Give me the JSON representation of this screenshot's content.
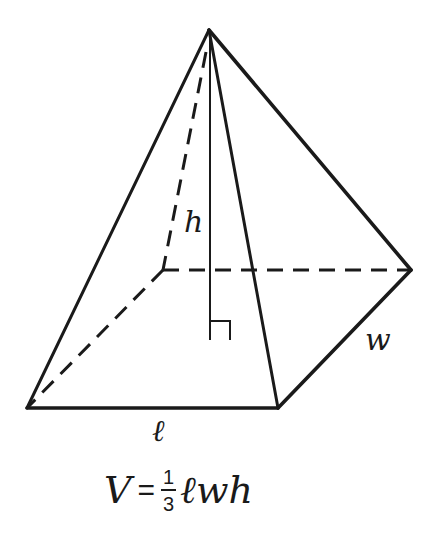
{
  "figure": {
    "type": "rectangular-pyramid",
    "vertices": {
      "apex": [
        209,
        30
      ],
      "front_left": [
        27,
        408
      ],
      "front_right": [
        278,
        408
      ],
      "back_right": [
        411,
        270
      ],
      "back_left": [
        163,
        270
      ],
      "height_foot": [
        210,
        340
      ]
    },
    "colors": {
      "stroke": "#1a1a1a",
      "background": "#ffffff"
    }
  },
  "labels": {
    "height": "h",
    "width": "w",
    "length": "ℓ"
  },
  "formula": {
    "lhs": "V",
    "equals": "=",
    "numerator": "1",
    "denominator": "3",
    "rhs_vars": "ℓwh"
  }
}
